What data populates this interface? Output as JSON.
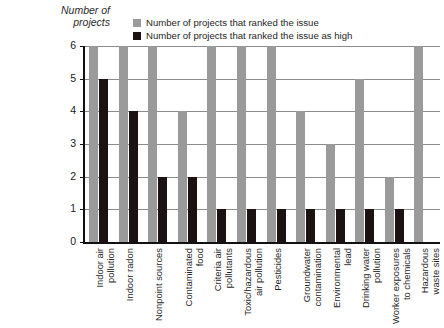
{
  "axis_title": {
    "line1": "Number of",
    "line2": "projects"
  },
  "legend": {
    "items": [
      {
        "label": "Number of projects that ranked the issue",
        "color": "#9a9a9a",
        "name": "legend-item-total"
      },
      {
        "label": "Number of projects that ranked the issue as high",
        "color": "#1c1211",
        "name": "legend-item-high"
      }
    ]
  },
  "y_ticks": [
    "6",
    "5",
    "4",
    "3",
    "2",
    "1",
    "0"
  ],
  "chart_data": {
    "type": "bar",
    "title": "",
    "subtitle": "",
    "xlabel": "",
    "ylabel": "Number of projects",
    "ylim": [
      0,
      6
    ],
    "yticks": [
      0,
      1,
      2,
      3,
      4,
      5,
      6
    ],
    "grid": true,
    "grid_axis": "y",
    "legend_position": "top-center",
    "orientation": "vertical",
    "grouping": "grouped",
    "categories": [
      "Indoor air pollution",
      "Indoor radon",
      "Nonpoint sources",
      "Contaminated food",
      "Criteria air pollutants",
      "Toxic/hazardous air pollution",
      "Pesticides",
      "Groundwater contamination",
      "Environmental lead",
      "Drinking water pollution",
      "Worker exposures to chemicals",
      "Hazardous waste sites"
    ],
    "category_lines": [
      [
        "Indoor air",
        "pollution"
      ],
      [
        "Indoor radon"
      ],
      [
        "Nonpoint sources"
      ],
      [
        "Contaminated",
        "food"
      ],
      [
        "Criteria air",
        "pollutants"
      ],
      [
        "Toxic/hazardous",
        "air pollution"
      ],
      [
        "Pesticides"
      ],
      [
        "Groundwater",
        "contamination"
      ],
      [
        "Environmental",
        "lead"
      ],
      [
        "Drinking water",
        "pollution"
      ],
      [
        "Worker exposures",
        "to chemicals"
      ],
      [
        "Hazardous",
        "waste sites"
      ]
    ],
    "series": [
      {
        "name": "Number of projects that ranked the issue",
        "color": "#9a9a9a",
        "values": [
          6,
          6,
          6,
          4,
          6,
          6,
          6,
          4,
          3,
          5,
          2,
          6
        ]
      },
      {
        "name": "Number of projects that ranked the issue as high",
        "color": "#1c1211",
        "values": [
          5,
          4,
          2,
          2,
          1,
          1,
          1,
          1,
          1,
          1,
          1,
          0
        ]
      }
    ]
  }
}
